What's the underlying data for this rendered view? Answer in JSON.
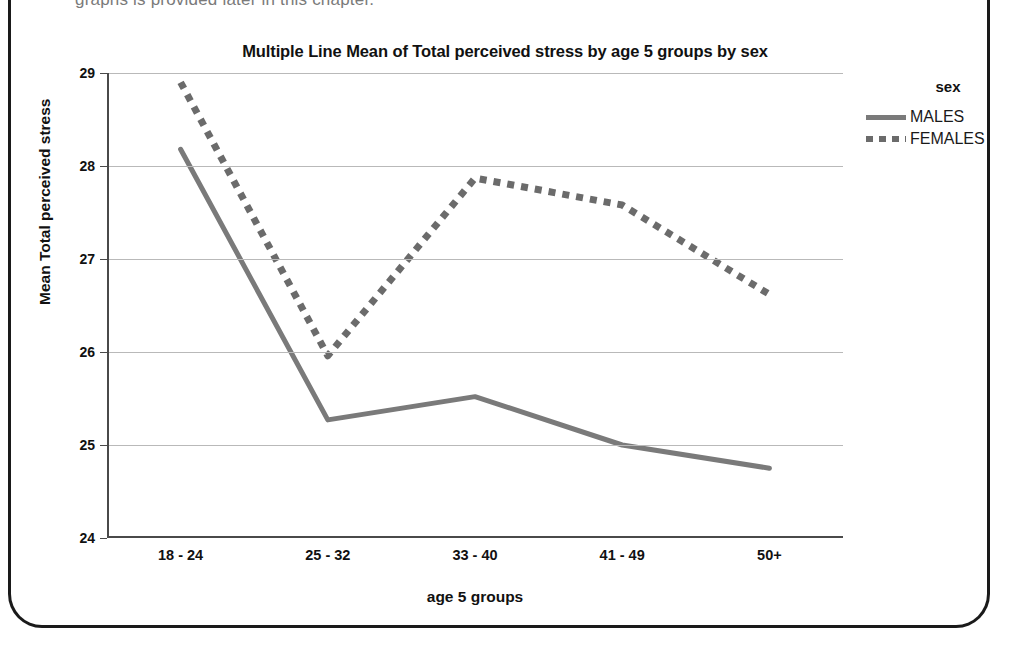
{
  "page": {
    "clipped_body_text": "graphs is provided later in this chapter."
  },
  "chart_data": {
    "type": "line",
    "title": "Multiple Line Mean of Total perceived stress by age 5 groups by sex",
    "xlabel": "age 5 groups",
    "ylabel": "Mean Total perceived stress",
    "categories": [
      "18 - 24",
      "25 - 32",
      "33 - 40",
      "41 - 49",
      "50+"
    ],
    "ylim": [
      24,
      29
    ],
    "yticks": [
      "24",
      "25",
      "26",
      "27",
      "28",
      "29"
    ],
    "grid": true,
    "legend_position": "right",
    "legend_title": "sex",
    "series": [
      {
        "name": "MALES",
        "style": "solid",
        "color": "#7a7a7a",
        "values": [
          28.18,
          25.27,
          25.52,
          25.0,
          24.75
        ]
      },
      {
        "name": "FEMALES",
        "style": "dotted",
        "color": "#6b6b6b",
        "values": [
          28.9,
          25.96,
          27.87,
          27.58,
          26.62
        ]
      }
    ]
  }
}
